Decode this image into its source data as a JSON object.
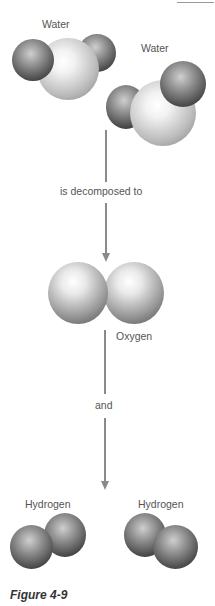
{
  "figure": {
    "caption": "Figure 4-9",
    "top_rule": true
  },
  "molecules": {
    "water_1": {
      "label": "Water"
    },
    "water_2": {
      "label": "Water"
    },
    "oxygen": {
      "label": "Oxygen"
    },
    "hydrogen_1": {
      "label": "Hydrogen"
    },
    "hydrogen_2": {
      "label": "Hydrogen"
    }
  },
  "arrows": {
    "first": {
      "label": "is decomposed to"
    },
    "second": {
      "label": "and"
    }
  },
  "colors": {
    "line": "#8a8a8a",
    "text": "#555555",
    "caption": "#333333"
  }
}
